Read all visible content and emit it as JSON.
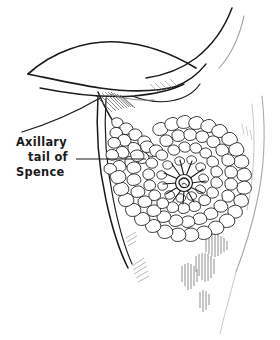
{
  "figure": {
    "title": "Axillary tail of Spence",
    "view": "anterolateral oblique",
    "style": "black ink line drawing",
    "width": 280,
    "height": 340,
    "background_color": "#ffffff",
    "ink_color": "#1a1a1a",
    "shading_color": "#555555"
  },
  "annotations": [
    {
      "name": "axillary-tail-label",
      "lines": [
        "Axillary",
        "tail of",
        "Spence"
      ],
      "line1": "Axillary",
      "line2": "tail of",
      "line3": "Spence",
      "text_anchor_x": 16,
      "line1_y": 146,
      "line2_y": 161,
      "line3_y": 176,
      "leader_line": {
        "name": "leader-line",
        "x1": 76,
        "y1": 159,
        "x2": 146,
        "y2": 159
      }
    }
  ],
  "structures": {
    "gland": {
      "name": "breast-glandular-tissue",
      "description": "radially arranged lobules forming the body of the breast",
      "center_x": 186,
      "center_y": 180,
      "radius_x": 62,
      "radius_y": 56
    },
    "nipple": {
      "name": "nipple-areola-complex",
      "center_x": 184,
      "center_y": 184,
      "radius": 9,
      "duct_count": 12
    },
    "axillary_tail": {
      "name": "axillary-tail-of-spence",
      "description": "tapering extension of glandular tissue toward the axilla",
      "tip_x": 112,
      "tip_y": 118
    },
    "axilla": {
      "name": "axillary-fold",
      "description": "armpit hollow between arm and chest wall"
    },
    "arm": {
      "name": "upper-arm-contour"
    },
    "torso": {
      "name": "torso-contour"
    }
  },
  "colors": {
    "background": "#ffffff",
    "ink": "#1a1a1a",
    "ink_light": "#4a4a4a",
    "ink_faint": "#8a8a8a",
    "hatch": "#555555"
  }
}
